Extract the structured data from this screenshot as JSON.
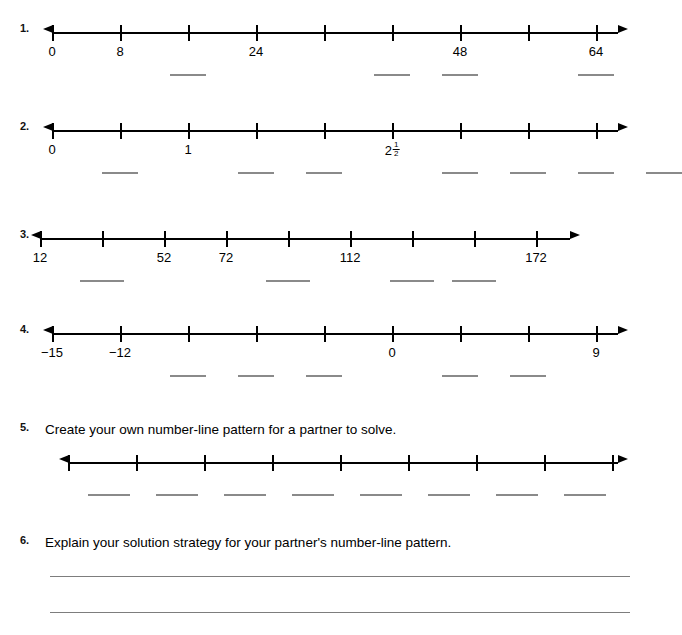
{
  "page": {
    "type": "math-worksheet",
    "topic": "number-line patterns",
    "width": 658,
    "height": 635,
    "ink_color": "#000000",
    "blank_color": "#8a8a8a",
    "rule_color": "#7d7d7d"
  },
  "problems": [
    {
      "number": "1.",
      "top": 22,
      "line": {
        "left": 52,
        "width": 566,
        "ticks": 9,
        "spacing": 68
      },
      "labels": [
        {
          "text": "0",
          "tick": 1
        },
        {
          "text": "8",
          "tick": 2
        },
        {
          "text": "24",
          "tick": 4
        },
        {
          "text": "48",
          "tick": 7
        },
        {
          "text": "64",
          "tick": 9
        }
      ],
      "blanks": [
        {
          "tick": 3,
          "width": 36
        },
        {
          "tick": 6,
          "width": 36
        },
        {
          "tick": 7,
          "width": 36
        },
        {
          "tick": 9,
          "width": 36
        }
      ]
    },
    {
      "number": "2.",
      "top": 120,
      "line": {
        "left": 52,
        "width": 566,
        "ticks": 9,
        "spacing": 68
      },
      "labels": [
        {
          "text": "0",
          "tick": 1
        },
        {
          "text": "1",
          "tick": 3
        },
        {
          "text": "2",
          "tick": 6,
          "fraction": {
            "numerator": "1",
            "denominator": "2"
          }
        }
      ],
      "blanks": [
        {
          "tick": 2,
          "width": 36
        },
        {
          "tick": 4,
          "width": 36
        },
        {
          "tick": 5,
          "width": 36
        },
        {
          "tick": 7,
          "width": 36
        },
        {
          "tick": 8,
          "width": 36
        },
        {
          "tick": 9,
          "width": 36
        },
        {
          "tick": 10,
          "width": 36
        }
      ]
    },
    {
      "number": "3.",
      "top": 228,
      "line": {
        "left": 40,
        "width": 530,
        "ticks": 9,
        "spacing": 62
      },
      "labels": [
        {
          "text": "12",
          "tick": 1
        },
        {
          "text": "52",
          "tick": 3
        },
        {
          "text": "72",
          "tick": 4
        },
        {
          "text": "112",
          "tick": 6
        },
        {
          "text": "172",
          "tick": 9
        }
      ],
      "blanks": [
        {
          "tick": 2,
          "width": 44
        },
        {
          "tick": 5,
          "width": 44
        },
        {
          "tick": 7,
          "width": 44
        },
        {
          "tick": 8,
          "width": 44
        }
      ]
    },
    {
      "number": "4.",
      "top": 323,
      "line": {
        "left": 52,
        "width": 566,
        "ticks": 9,
        "spacing": 68
      },
      "labels": [
        {
          "text": "−15",
          "tick": 1
        },
        {
          "text": "−12",
          "tick": 2
        },
        {
          "text": "0",
          "tick": 6
        },
        {
          "text": "9",
          "tick": 9
        }
      ],
      "blanks": [
        {
          "tick": 3,
          "width": 36
        },
        {
          "tick": 4,
          "width": 36
        },
        {
          "tick": 5,
          "width": 36
        },
        {
          "tick": 7,
          "width": 36
        },
        {
          "tick": 8,
          "width": 36
        }
      ]
    }
  ],
  "item5": {
    "number": "5.",
    "prompt": "Create your own number-line pattern for a partner to solve.",
    "prompt_top": 421,
    "line": {
      "top": 452,
      "left": 68,
      "width": 550,
      "ticks": 9,
      "spacing": 68
    },
    "blank_row_top": 494,
    "blanks": [
      {
        "left": 88,
        "width": 42
      },
      {
        "left": 156,
        "width": 42
      },
      {
        "left": 224,
        "width": 42
      },
      {
        "left": 292,
        "width": 42
      },
      {
        "left": 360,
        "width": 42
      },
      {
        "left": 428,
        "width": 42
      },
      {
        "left": 496,
        "width": 42
      },
      {
        "left": 564,
        "width": 42
      }
    ]
  },
  "item6": {
    "number": "6.",
    "prompt": "Explain your solution strategy for your partner's number-line pattern.",
    "prompt_top": 534,
    "rules": [
      {
        "top": 576,
        "left": 50,
        "width": 580
      },
      {
        "top": 612,
        "left": 50,
        "width": 580
      }
    ]
  }
}
